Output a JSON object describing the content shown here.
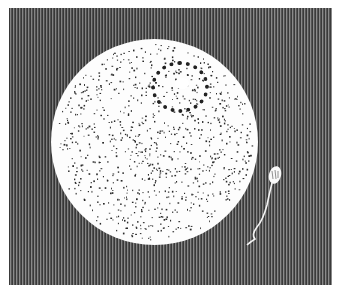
{
  "figure": {
    "background_color": "#5a5a5a",
    "egg_color": "#fdfdfd",
    "dot_color": "#222222",
    "labels": []
  }
}
